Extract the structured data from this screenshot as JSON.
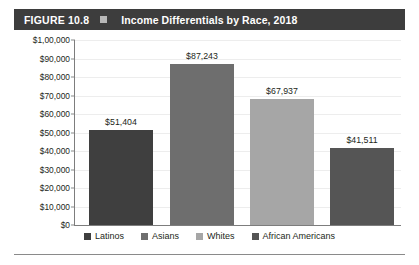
{
  "header": {
    "figure_number": "FIGURE 10.8",
    "title": "Income Differentials by Race, 2018",
    "bar_color": "#3d3d3d",
    "text_color": "#ffffff",
    "square_color": "#b8b8b8"
  },
  "chart_data": {
    "type": "bar",
    "title": "Income Differentials by Race, 2018",
    "xlabel": "",
    "ylabel": "",
    "categories": [
      "Latinos",
      "Asians",
      "Whites",
      "African Americans"
    ],
    "values": [
      51404,
      87243,
      67937,
      41511
    ],
    "value_labels": [
      "$51,404",
      "$87,243",
      "$67,937",
      "$41,511"
    ],
    "colors": [
      "#3f3f3f",
      "#6e6e6e",
      "#a6a6a6",
      "#555555"
    ],
    "ylim": [
      0,
      100000
    ],
    "ytick_labels": [
      "$1,00,000",
      "$90,000",
      "$80,000",
      "$70,000",
      "$60,000",
      "$50,000",
      "$40,000",
      "$30,000",
      "$20,000",
      "$10,000",
      "$0"
    ],
    "ytick_values": [
      100000,
      90000,
      80000,
      70000,
      60000,
      50000,
      40000,
      30000,
      20000,
      10000,
      0
    ],
    "grid": true,
    "legend_position": "bottom"
  },
  "legend": {
    "items": [
      {
        "label": "Latinos",
        "color": "#3f3f3f"
      },
      {
        "label": "Asians",
        "color": "#6e6e6e"
      },
      {
        "label": "Whites",
        "color": "#a6a6a6"
      },
      {
        "label": "African Americans",
        "color": "#555555"
      }
    ]
  }
}
